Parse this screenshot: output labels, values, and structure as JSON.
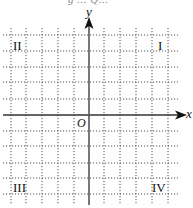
{
  "figure": {
    "top_clipped_text": "g  ... Q...",
    "axes": {
      "x_label": "x",
      "y_label": "y",
      "origin_label": "O"
    },
    "quadrants": [
      {
        "id": "I",
        "label": "I"
      },
      {
        "id": "II",
        "label": "II"
      },
      {
        "id": "III",
        "label": "III"
      },
      {
        "id": "IV",
        "label": "IV"
      }
    ],
    "grid": {
      "style": "dotted",
      "vertical_lines_x": [
        11,
        26,
        42,
        58,
        74,
        104,
        120,
        136,
        152,
        168
      ],
      "horizontal_lines_y": [
        35,
        51,
        67,
        82,
        99,
        131,
        146,
        163,
        178,
        194
      ],
      "y_axis_x": 89,
      "x_axis_y": 115,
      "cells_left_of_origin": 5,
      "cells_right_of_origin": 5,
      "cells_above_origin": 5,
      "cells_below_origin": 5
    },
    "colors": {
      "grid": "#555555",
      "axis": "#333333",
      "text": "#111111"
    }
  }
}
